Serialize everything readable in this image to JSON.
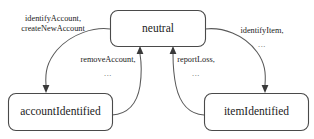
{
  "diagram": {
    "type": "uml-state-machine",
    "title": "",
    "states": [
      {
        "id": "neutral",
        "label": "neutral",
        "x": 110,
        "y": 10,
        "width": 95,
        "height": 36
      },
      {
        "id": "accountIdentified",
        "label": "accountIdentified",
        "x": 8,
        "y": 93,
        "width": 104,
        "height": 37
      },
      {
        "id": "itemIdentified",
        "label": "itemIdentified",
        "x": 204,
        "y": 93,
        "width": 104,
        "height": 37
      }
    ],
    "transitions": [
      {
        "id": "neutral-to-accountIdentified",
        "from": "neutral",
        "to": "accountIdentified",
        "label_lines": [
          "identifyAccount,",
          "createNewAccount"
        ],
        "label_x": 53,
        "label_y": 19
      },
      {
        "id": "accountIdentified-to-neutral",
        "from": "accountIdentified",
        "to": "neutral",
        "label_lines": [
          "removeAccount,",
          "..."
        ],
        "label_x": 108,
        "label_y": 60
      },
      {
        "id": "neutral-to-itemIdentified",
        "from": "neutral",
        "to": "itemIdentified",
        "label_lines": [
          "identifyItem,",
          "..."
        ],
        "label_x": 262,
        "label_y": 19
      },
      {
        "id": "itemIdentified-to-neutral",
        "from": "itemIdentified",
        "to": "neutral",
        "label_lines": [
          "reportLoss,",
          "..."
        ],
        "label_x": 196,
        "label_y": 60
      }
    ],
    "colors": {
      "background": "#ffffff",
      "box_stroke": "#4a4a4a",
      "box_fill": "#ffffff",
      "edge_stroke": "#5a5a5a",
      "arrow_fill": "#3a3a3a",
      "text": "#1c1c1c"
    }
  }
}
